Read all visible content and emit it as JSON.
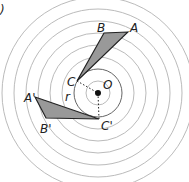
{
  "figure": {
    "part_label": ")",
    "center": {
      "label": "O",
      "x": 98,
      "y": 93
    },
    "ring_radii": [
      12,
      24,
      36,
      48,
      60,
      72,
      84,
      96
    ],
    "highlight_ring_radius": 24,
    "radius_label": "r",
    "original_triangle": {
      "fill": "#999999",
      "vertices": {
        "A": [
          128,
          32
        ],
        "B": [
          104,
          33
        ],
        "C": [
          77,
          81
        ]
      },
      "labels": {
        "A": "A",
        "B": "B",
        "C": "C"
      }
    },
    "image_triangle": {
      "fill": "#999999",
      "vertices": {
        "A'": [
          35,
          97
        ],
        "B'": [
          46,
          118
        ],
        "C'": [
          99,
          119
        ]
      },
      "labels": {
        "A'": "A'",
        "B'": "B'",
        "C'": "C'"
      }
    }
  }
}
